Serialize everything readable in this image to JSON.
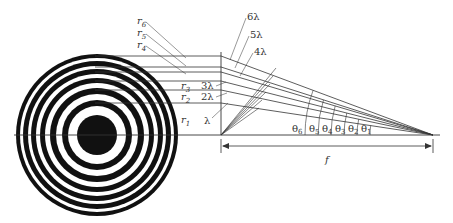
{
  "diagram": {
    "colors": {
      "ink": "#111111",
      "line": "#333333",
      "background": "#ffffff"
    },
    "zone_plate": {
      "center": [
        97,
        135
      ],
      "rings": [
        {
          "r": 81,
          "fill": "#111111"
        },
        {
          "r": 77,
          "fill": "#ffffff"
        },
        {
          "r": 74,
          "fill": "#111111"
        },
        {
          "r": 69,
          "fill": "#ffffff"
        },
        {
          "r": 66,
          "fill": "#111111"
        },
        {
          "r": 61,
          "fill": "#ffffff"
        },
        {
          "r": 57,
          "fill": "#111111"
        },
        {
          "r": 52,
          "fill": "#ffffff"
        },
        {
          "r": 47,
          "fill": "#111111"
        },
        {
          "r": 41,
          "fill": "#ffffff"
        },
        {
          "r": 35,
          "fill": "#111111"
        },
        {
          "r": 29,
          "fill": "#ffffff"
        },
        {
          "r": 20,
          "fill": "#111111"
        }
      ]
    },
    "radius_labels": [
      {
        "text": "r",
        "sub": "6",
        "x": 137,
        "y": 24
      },
      {
        "text": "r",
        "sub": "5",
        "x": 137,
        "y": 36
      },
      {
        "text": "r",
        "sub": "4",
        "x": 137,
        "y": 48
      },
      {
        "text": "r",
        "sub": "3",
        "x": 181,
        "y": 89
      },
      {
        "text": "r",
        "sub": "2",
        "x": 181,
        "y": 100
      },
      {
        "text": "r",
        "sub": "1",
        "x": 181,
        "y": 123
      }
    ],
    "path_labels": [
      {
        "text": "6λ",
        "x": 247,
        "y": 20
      },
      {
        "text": "5λ",
        "x": 250,
        "y": 38
      },
      {
        "text": "4λ",
        "x": 254,
        "y": 55
      },
      {
        "text": "3λ",
        "x": 201,
        "y": 89
      },
      {
        "text": "2λ",
        "x": 201,
        "y": 100
      },
      {
        "text": "λ",
        "x": 204,
        "y": 124
      }
    ],
    "angle_labels": [
      {
        "text": "θ",
        "sub": "6",
        "x": 292
      },
      {
        "text": "θ",
        "sub": "5",
        "x": 309
      },
      {
        "text": "θ",
        "sub": "4",
        "x": 322
      },
      {
        "text": "θ",
        "sub": "3",
        "x": 335
      },
      {
        "text": "θ",
        "sub": "2",
        "x": 348
      },
      {
        "text": "θ",
        "sub": "1",
        "x": 361
      }
    ],
    "focal_length_label": "f",
    "lens_x": 221,
    "focus": [
      433,
      135
    ],
    "ray_heights": [
      56,
      67,
      72,
      81,
      90,
      103
    ]
  }
}
